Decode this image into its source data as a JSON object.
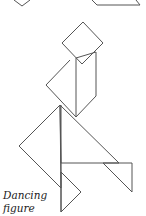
{
  "caption": {
    "line1": "Dancing",
    "line2": "figure"
  },
  "colors": {
    "stroke": "#555555",
    "background": "#ffffff",
    "text": "#222222"
  },
  "shapes": [
    {
      "name": "top-left-partial-piece",
      "points": "14,0 22,6 30,0"
    },
    {
      "name": "top-right-partial-piece",
      "points": "92,0 97,5 140,5 136,0"
    },
    {
      "name": "head-square",
      "points": "83,22 103,43 82,64 62,43"
    },
    {
      "name": "body-parallelogram",
      "points": "76,58 96,52 96,96 76,117"
    },
    {
      "name": "torso-triangle",
      "points": "60,105 76,117 76,58 60,75"
    },
    {
      "name": "left-large-triangle",
      "points": "60,105 19,146 61,188"
    },
    {
      "name": "right-large-triangle",
      "points": "60,105 119,163 61,163"
    },
    {
      "name": "right-small-triangle",
      "points": "103,163 132,163 132,192"
    },
    {
      "name": "bottom-small-triangle",
      "points": "61,172 81,192 61,212"
    }
  ]
}
